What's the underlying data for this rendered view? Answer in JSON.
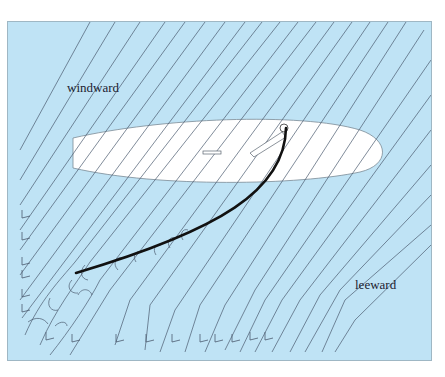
{
  "diagram": {
    "labels": {
      "windward": "windward",
      "leeward": "leeward"
    },
    "colors": {
      "background": "#bfe3f5",
      "hull": "#ffffff",
      "streamline": "#4b5a6e",
      "sail": "#111111"
    },
    "elements": [
      "hull",
      "sail",
      "boom",
      "centreboard-slot",
      "streamlines",
      "eddies"
    ]
  }
}
